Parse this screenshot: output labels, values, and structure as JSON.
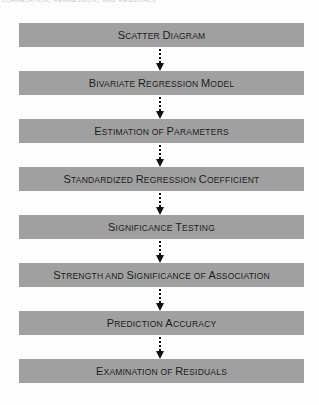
{
  "diagram": {
    "cut_header_text": "correlation, regression, and residuals",
    "box_color": "#a0a0a0",
    "text_color": "#1c1c1c",
    "arrow_style": "dotted-down-arrow",
    "steps": [
      {
        "label": "Scatter Diagram"
      },
      {
        "label": "Bivariate Regression Model"
      },
      {
        "label": "Estimation of Parameters"
      },
      {
        "label": "Standardized Regression Coefficient"
      },
      {
        "label": "Significance Testing"
      },
      {
        "label": "Strength and Significance of Association"
      },
      {
        "label": "Prediction Accuracy"
      },
      {
        "label": "Examination of Residuals"
      }
    ]
  }
}
